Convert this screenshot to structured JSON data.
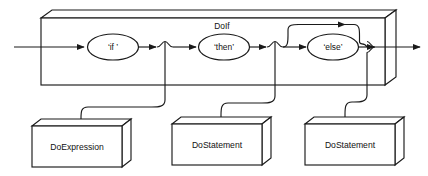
{
  "diagram": {
    "kind": "railroad-syntax-diagram",
    "rule_label": "DoIf",
    "stroke_color": "#1a1a1a",
    "background_color": "#ffffff",
    "tokens": [
      {
        "id": "if",
        "label": "‘if ’"
      },
      {
        "id": "then",
        "label": "‘then’"
      },
      {
        "id": "else",
        "label": "‘else’"
      }
    ],
    "action_boxes": [
      {
        "id": "do-expression",
        "label": "DoExpression"
      },
      {
        "id": "do-statement-then",
        "label": "DoStatement"
      },
      {
        "id": "do-statement-else",
        "label": "DoStatement"
      }
    ],
    "paths": {
      "entry": "entry-arrow",
      "exit": "exit-arrow",
      "bypass": "else-bypass-arc"
    }
  }
}
